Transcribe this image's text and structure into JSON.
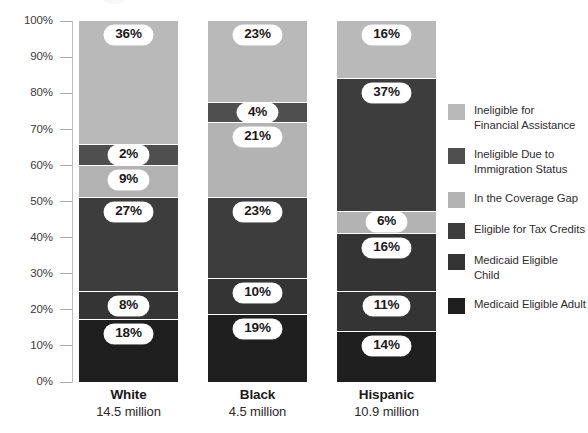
{
  "chart_data": {
    "type": "bar",
    "subtype": "stacked-100-percent",
    "title": "",
    "xlabel": "",
    "ylabel": "",
    "ylim": [
      0,
      100
    ],
    "grid": false,
    "legend_position": "right",
    "categories": [
      "White",
      "Black",
      "Hispanic"
    ],
    "category_sublabels": [
      "14.5 million",
      "4.5 million",
      "10.9 million"
    ],
    "ytick_labels": [
      "100%",
      "90%",
      "80%",
      "70%",
      "60%",
      "50%",
      "40%",
      "30%",
      "20%",
      "10%",
      "0%"
    ],
    "ytick_values": [
      100,
      90,
      80,
      70,
      60,
      50,
      40,
      30,
      20,
      10,
      0
    ],
    "series": [
      {
        "name": "Ineligible for Financial Assistance",
        "color": "#b9b9b9",
        "values": [
          36,
          23,
          16
        ],
        "labels": [
          "36%",
          "23%",
          "16%"
        ]
      },
      {
        "name": "Ineligible Due to Immigration Status",
        "color": "#4f4f4f",
        "values": [
          2,
          4,
          0
        ],
        "labels": [
          "2%",
          "4%",
          ""
        ]
      },
      {
        "name": "In the Coverage Gap",
        "color": "#b3b3b3",
        "values": [
          9,
          21,
          6
        ],
        "labels": [
          "9%",
          "21%",
          "6%"
        ]
      },
      {
        "name": "Eligible for Tax Credits",
        "color": "#3d3d3d",
        "values": [
          27,
          23,
          37
        ],
        "labels": [
          "27%",
          "23%",
          "37%"
        ]
      },
      {
        "name": "Medicaid Eligible Child",
        "color": "#343434",
        "values": [
          8,
          10,
          16
        ],
        "labels": [
          "8%",
          "10%",
          "16%"
        ]
      },
      {
        "name": "Medicaid Eligible Adult",
        "color": "#1f1f1f",
        "values": [
          18,
          19,
          11
        ],
        "labels": [
          "18%",
          "19%",
          "11%"
        ]
      }
    ],
    "bars": [
      {
        "category": "White",
        "sublabel": "14.5 million",
        "segments": [
          {
            "series": "Ineligible for Financial Assistance",
            "value": 36,
            "label": "36%",
            "color": "#b9b9b9"
          },
          {
            "series": "Ineligible Due to Immigration Status",
            "value": 2,
            "label": "2%",
            "color": "#4f4f4f"
          },
          {
            "series": "In the Coverage Gap",
            "value": 9,
            "label": "9%",
            "color": "#b3b3b3"
          },
          {
            "series": "Eligible for Tax Credits",
            "value": 27,
            "label": "27%",
            "color": "#3d3d3d"
          },
          {
            "series": "Medicaid Eligible Child",
            "value": 8,
            "label": "8%",
            "color": "#343434"
          },
          {
            "series": "Medicaid Eligible Adult",
            "value": 18,
            "label": "18%",
            "color": "#1f1f1f"
          }
        ]
      },
      {
        "category": "Black",
        "sublabel": "4.5 million",
        "segments": [
          {
            "series": "Ineligible for Financial Assistance",
            "value": 23,
            "label": "23%",
            "color": "#b9b9b9"
          },
          {
            "series": "Ineligible Due to Immigration Status",
            "value": 4,
            "label": "4%",
            "color": "#4f4f4f"
          },
          {
            "series": "In the Coverage Gap",
            "value": 21,
            "label": "21%",
            "color": "#b3b3b3"
          },
          {
            "series": "Eligible for Tax Credits",
            "value": 23,
            "label": "23%",
            "color": "#3d3d3d"
          },
          {
            "series": "Medicaid Eligible Child",
            "value": 10,
            "label": "10%",
            "color": "#343434"
          },
          {
            "series": "Medicaid Eligible Adult",
            "value": 19,
            "label": "19%",
            "color": "#1f1f1f"
          }
        ]
      },
      {
        "category": "Hispanic",
        "sublabel": "10.9 million",
        "segments": [
          {
            "series": "Ineligible for Financial Assistance",
            "value": 16,
            "label": "16%",
            "color": "#b9b9b9"
          },
          {
            "series": "Eligible for Tax Credits",
            "value": 37,
            "label": "37%",
            "color": "#3d3d3d"
          },
          {
            "series": "In the Coverage Gap",
            "value": 6,
            "label": "6%",
            "color": "#b3b3b3"
          },
          {
            "series": "Medicaid Eligible Child",
            "value": 16,
            "label": "16%",
            "color": "#343434"
          },
          {
            "series": "Eligible for Tax Credits (lower)",
            "value": 11,
            "label": "11%",
            "color": "#343434"
          },
          {
            "series": "Medicaid Eligible Adult",
            "value": 14,
            "label": "14%",
            "color": "#1f1f1f"
          }
        ]
      }
    ]
  },
  "legend": {
    "items": [
      {
        "label_line1": "Ineligible for",
        "label_line2": "Financial Assistance",
        "color": "#b9b9b9"
      },
      {
        "label_line1": "Ineligible Due to",
        "label_line2": "Immigration Status",
        "color": "#4f4f4f"
      },
      {
        "label_line1": "In the Coverage Gap",
        "label_line2": "",
        "color": "#b3b3b3"
      },
      {
        "label_line1": "Eligible for Tax Credits",
        "label_line2": "",
        "color": "#3d3d3d"
      },
      {
        "label_line1": "Medicaid Eligible Child",
        "label_line2": "",
        "color": "#343434"
      },
      {
        "label_line1": "Medicaid Eligible Adult",
        "label_line2": "",
        "color": "#1f1f1f"
      }
    ]
  },
  "axis": {
    "line_color": "#bdbdbd",
    "tick_color": "#a6a6a6"
  }
}
